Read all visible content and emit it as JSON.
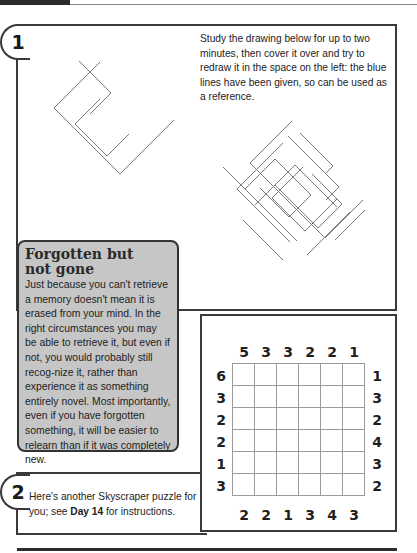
{
  "exercise1": {
    "number": "1",
    "instructions": "Study the drawing below for up to two minutes, then cover it over and try to redraw it in the space on the left: the blue lines have been given, so can be used as a reference."
  },
  "note": {
    "title_line1": "Forgotten but",
    "title_line2": "not gone",
    "body": "Just because you can't retrieve a memory doesn't mean it is erased from your mind. In the right circumstances you may be able to retrieve it, but even if not, you would probably still recog-nize it, rather than experience it as something entirely novel. Most importantly, even if you have forgotten something, it will be easier to relearn than if it was completely new."
  },
  "exercise2": {
    "number": "2",
    "text_before": "Here's another Skyscraper puzzle for you; see ",
    "text_bold": "Day 14",
    "text_after": " for instructions."
  },
  "skyscraper": {
    "size": 6,
    "top": [
      "5",
      "3",
      "3",
      "2",
      "2",
      "1"
    ],
    "bottom": [
      "2",
      "2",
      "1",
      "3",
      "4",
      "3"
    ],
    "left": [
      "6",
      "3",
      "2",
      "2",
      "1",
      "3"
    ],
    "right": [
      "1",
      "3",
      "2",
      "4",
      "3",
      "2"
    ]
  },
  "colors": {
    "note_fill": "#c6c6c6",
    "border": "#3a3a3a",
    "line_drawing": "#7a7a7a"
  }
}
